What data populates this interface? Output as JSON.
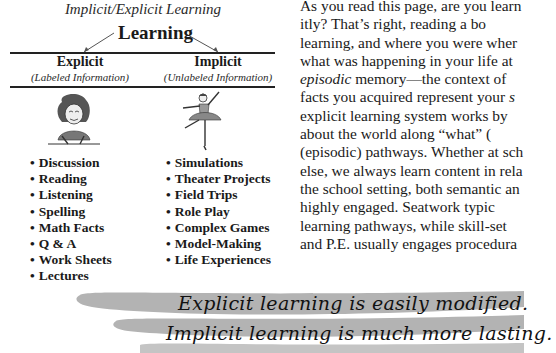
{
  "figure": {
    "title": "Implicit/Explicit Learning",
    "root_label": "Learning",
    "columns": [
      {
        "heading": "Explicit",
        "subheading": "(Labeled Information)",
        "illustration": "teacher-writing-icon",
        "items": [
          "Discussion",
          "Reading",
          "Listening",
          "Spelling",
          "Math Facts",
          "Q & A",
          "Work Sheets",
          "Lectures"
        ]
      },
      {
        "heading": "Implicit",
        "subheading": "(Unlabeled Information)",
        "illustration": "ballerina-icon",
        "items": [
          "Simulations",
          "Theater Projects",
          "Field Trips",
          "Role Play",
          "Complex Games",
          "Model-Making",
          "Life Experiences"
        ]
      }
    ]
  },
  "body_text": {
    "lines": [
      {
        "parts": [
          {
            "t": "As you read this page, are you learn"
          }
        ]
      },
      {
        "parts": [
          {
            "t": "itly? That’s right, reading a bo"
          }
        ]
      },
      {
        "parts": [
          {
            "t": "learning, and where you were wher"
          }
        ]
      },
      {
        "parts": [
          {
            "t": "what was happening in your life at"
          }
        ]
      },
      {
        "parts": [
          {
            "t": "episodic",
            "i": true
          },
          {
            "t": " memory—the context of"
          }
        ]
      },
      {
        "parts": [
          {
            "t": "facts you acquired represent your "
          },
          {
            "t": "s",
            "i": true
          }
        ]
      },
      {
        "parts": [
          {
            "t": "explicit learning system works by"
          }
        ]
      },
      {
        "parts": [
          {
            "t": "about the world along “what” ("
          }
        ]
      },
      {
        "parts": [
          {
            "t": "(episodic) pathways. Whether at sch"
          }
        ]
      },
      {
        "parts": [
          {
            "t": "else, we always learn content in rela"
          }
        ]
      },
      {
        "parts": [
          {
            "t": "the school setting, both semantic an"
          }
        ]
      },
      {
        "parts": [
          {
            "t": "highly engaged. Seatwork typic"
          }
        ]
      },
      {
        "parts": [
          {
            "t": "learning pathways, while skill-set"
          }
        ]
      },
      {
        "parts": [
          {
            "t": "and P.E. usually engages procedura"
          }
        ]
      }
    ]
  },
  "banner": {
    "line1": "Explicit learning is easily modified.",
    "line2": "Implicit learning is much more lasting.",
    "swoosh_color": "#b3b3b3"
  }
}
